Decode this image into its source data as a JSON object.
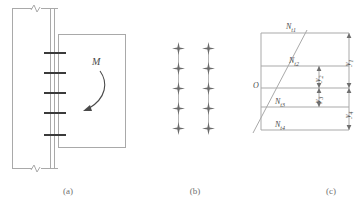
{
  "figure": {
    "type": "engineering-diagram",
    "line_color": "#a9a9a9",
    "bolt_color": "#3b3b3b",
    "text_color": "#4a4a4a",
    "background": "#ffffff"
  },
  "captions": {
    "a": "(a)",
    "b": "(b)",
    "c": "(c)"
  },
  "panel_a": {
    "name": "connection-elevation",
    "moment_label": "M",
    "bolt_rows": 5,
    "bolt_row_y": [
      52,
      72,
      92,
      112,
      134
    ],
    "column_left_x": 12,
    "column_right_x": 58,
    "endplate_x": [
      50,
      56
    ],
    "beam_rect": {
      "x": 60,
      "y": 34,
      "w": 65,
      "h": 113
    },
    "break_marks": 2
  },
  "panel_b": {
    "name": "bolt-group-layout",
    "columns": 2,
    "rows": 5,
    "column_x": [
      28,
      58
    ],
    "row_y": [
      48,
      68,
      88,
      108,
      128
    ],
    "bolt_symbol": "four-point-star"
  },
  "panel_c": {
    "name": "bolt-tension-distribution",
    "origin_label": "O",
    "forces": [
      {
        "id": "Nt1",
        "base": "N",
        "sub": "t1",
        "y": 33
      },
      {
        "id": "Nt2",
        "base": "N",
        "sub": "t2",
        "y": 66
      },
      {
        "id": "Nt3",
        "base": "N",
        "sub": "t3",
        "y": 107
      },
      {
        "id": "Nt4",
        "base": "N",
        "sub": "t4",
        "y": 130
      }
    ],
    "dimensions": [
      {
        "id": "y1",
        "base": "y",
        "sub": "1",
        "from_y": 33,
        "to_y": 88,
        "x": 104
      },
      {
        "id": "y2",
        "base": "y",
        "sub": "2",
        "from_y": 66,
        "to_y": 88,
        "x": 74
      },
      {
        "id": "y3",
        "base": "y",
        "sub": "3",
        "from_y": 88,
        "to_y": 107,
        "x": 74
      },
      {
        "id": "y4",
        "base": "y",
        "sub": "4",
        "from_y": 88,
        "to_y": 130,
        "x": 104
      }
    ],
    "axis_x": 16,
    "neutral_axis_y": 88,
    "diagram_right_x": 104,
    "triangle_apex_top": {
      "x": 62,
      "y": 33
    },
    "triangle_base_bottom": {
      "x": 8,
      "y": 130
    }
  }
}
